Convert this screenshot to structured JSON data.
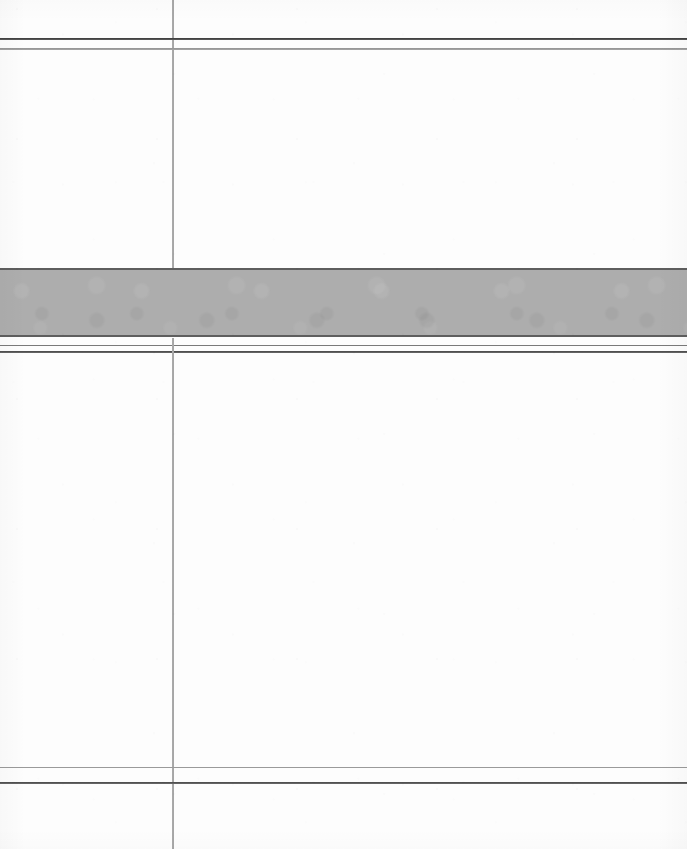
{
  "document": {
    "kind": "scanned-blank-ruled-sheet",
    "page_width": 687,
    "page_height": 849,
    "paper_color": "#fdfdfd",
    "has_text": false,
    "text_content": ""
  },
  "palette": {
    "paper": "#fdfdfd",
    "rule_dark": "#3c3c3c",
    "rule_medium": "#6a6a6a",
    "rule_light": "#9a9a9a",
    "rule_faint": "#b6b6b6",
    "band_fill": "#adadad",
    "band_edge": "#5e5e5e"
  },
  "horizontal_rules": [
    {
      "name": "top-rule-primary",
      "y": 38,
      "thickness": 2,
      "color": "#3c3c3c",
      "weight": "dark"
    },
    {
      "name": "top-rule-secondary",
      "y": 48,
      "thickness": 2,
      "color": "#8e8e8e",
      "weight": "light"
    },
    {
      "name": "band-lower-rule",
      "y": 345,
      "thickness": 1,
      "color": "#6a6a6a",
      "weight": "medium"
    },
    {
      "name": "band-lower-rule-2",
      "y": 352,
      "thickness": 2,
      "color": "#4a4a4a",
      "weight": "dark"
    },
    {
      "name": "bottom-rule-primary",
      "y": 768,
      "thickness": 1,
      "color": "#8e8e8e",
      "weight": "light"
    },
    {
      "name": "bottom-rule-secondary",
      "y": 783,
      "thickness": 2,
      "color": "#4a4a4a",
      "weight": "dark"
    }
  ],
  "vertical_rules": [
    {
      "name": "column-divider",
      "x": 172,
      "thickness": 2,
      "color": "#9a9a9a",
      "segments": [
        {
          "top": 0,
          "height": 268
        },
        {
          "top": 338,
          "height": 511
        }
      ]
    }
  ],
  "gray_band": {
    "name": "shaded-band",
    "top": 268,
    "height": 69,
    "left": 0,
    "width": 687,
    "fill": "#adadad",
    "edge_color": "#5e5e5e",
    "edge_thickness": 2
  },
  "regions": [
    {
      "name": "header-strip",
      "top": 0,
      "height": 38,
      "content": ""
    },
    {
      "name": "upper-left-cell",
      "top": 49,
      "height": 219,
      "content": ""
    },
    {
      "name": "upper-right-cell",
      "top": 49,
      "height": 219,
      "content": ""
    },
    {
      "name": "shaded-band-region",
      "top": 268,
      "height": 69,
      "content": ""
    },
    {
      "name": "lower-left-cell",
      "top": 354,
      "height": 414,
      "content": ""
    },
    {
      "name": "lower-right-cell",
      "top": 354,
      "height": 414,
      "content": ""
    },
    {
      "name": "footer-left-cell",
      "top": 785,
      "height": 64,
      "content": ""
    },
    {
      "name": "footer-right-cell",
      "top": 785,
      "height": 64,
      "content": ""
    }
  ]
}
